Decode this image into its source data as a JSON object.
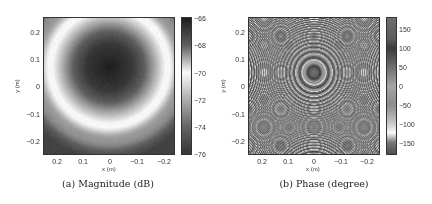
{
  "chart_data": [
    {
      "type": "heatmap",
      "title": "(a) Magnitude (dB)",
      "caption": "(a) Magnitude (dB)",
      "xlabel": "x (m)",
      "ylabel": "y (m)",
      "xlim": [
        0.25,
        -0.25
      ],
      "ylim": [
        -0.25,
        0.25
      ],
      "xticks": [
        0.2,
        0.1,
        0,
        -0.1,
        -0.2
      ],
      "xtick_labels": [
        "0.2",
        "0.1",
        "0",
        "−0.1",
        "−0.2"
      ],
      "yticks": [
        0.2,
        0.1,
        0,
        -0.1,
        -0.2
      ],
      "ytick_labels": [
        "0.2",
        "0.1",
        "0",
        "−0.1",
        "−0.2"
      ],
      "colorbar": {
        "range": [
          -76,
          -66
        ],
        "ticks": [
          -66,
          -68,
          -70,
          -72,
          -74,
          -76
        ],
        "tick_labels": [
          "−66",
          "−68",
          "−70",
          "−72",
          "−74",
          "−76"
        ],
        "colormap_stops": [
          {
            "value": -66,
            "gray": 30
          },
          {
            "value": -68,
            "gray": 95
          },
          {
            "value": -70,
            "gray": 250
          },
          {
            "value": -72,
            "gray": 175
          },
          {
            "value": -74,
            "gray": 100
          },
          {
            "value": -76,
            "gray": 55
          }
        ]
      },
      "field": {
        "description": "dark disk centered near (0, 0.07) m with bright ring of radius ~0.22 m",
        "center": [
          0.0,
          0.07
        ],
        "ring_radius": 0.22
      },
      "grid": false
    },
    {
      "type": "heatmap",
      "title": "(b) Phase (degree)",
      "caption": "(b) Phase (degree)",
      "xlabel": "x (m)",
      "ylabel": "y (m)",
      "xlim": [
        0.25,
        -0.25
      ],
      "ylim": [
        -0.25,
        0.25
      ],
      "xticks": [
        0.2,
        0.1,
        0,
        -0.1,
        -0.2
      ],
      "xtick_labels": [
        "0.2",
        "0.1",
        "0",
        "−0.1",
        "−0.2"
      ],
      "yticks": [
        0.2,
        0.1,
        0,
        -0.1,
        -0.2
      ],
      "ytick_labels": [
        "0.2",
        "0.1",
        "0",
        "−0.1",
        "−0.2"
      ],
      "colorbar": {
        "range": [
          -180,
          180
        ],
        "ticks": [
          150,
          100,
          50,
          0,
          -50,
          -100,
          -150
        ],
        "tick_labels": [
          "150",
          "100",
          "50",
          "0",
          "−50",
          "−100",
          "−150"
        ],
        "colormap_stops": [
          {
            "value": 180,
            "gray": 110
          },
          {
            "value": 130,
            "gray": 95
          },
          {
            "value": 100,
            "gray": 60
          },
          {
            "value": 50,
            "gray": 110
          },
          {
            "value": 0,
            "gray": 165
          },
          {
            "value": -50,
            "gray": 140
          },
          {
            "value": -100,
            "gray": 200
          },
          {
            "value": -125,
            "gray": 250
          },
          {
            "value": -150,
            "gray": 120
          },
          {
            "value": -180,
            "gray": 80
          }
        ]
      },
      "field": {
        "description": "concentric wrapped-phase rings centered near (0, 0.05) m, ring spacing decreasing outward",
        "center": [
          0.0,
          0.05
        ]
      },
      "grid": false
    }
  ]
}
